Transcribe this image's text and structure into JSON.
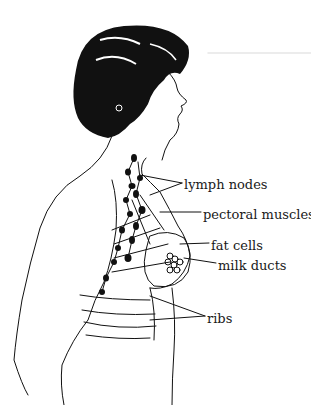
{
  "diagram": {
    "line_color": "#111111",
    "background": "#ffffff",
    "labels": [
      {
        "id": "lymph-nodes",
        "text": "lymph nodes",
        "x": 184,
        "y": 178
      },
      {
        "id": "pectoral-muscles",
        "text": "pectoral muscles",
        "x": 203,
        "y": 208
      },
      {
        "id": "fat-cells",
        "text": "fat cells",
        "x": 211,
        "y": 239
      },
      {
        "id": "milk-ducts",
        "text": "milk ducts",
        "x": 218,
        "y": 259
      },
      {
        "id": "ribs",
        "text": "ribs",
        "x": 207,
        "y": 312
      }
    ]
  }
}
